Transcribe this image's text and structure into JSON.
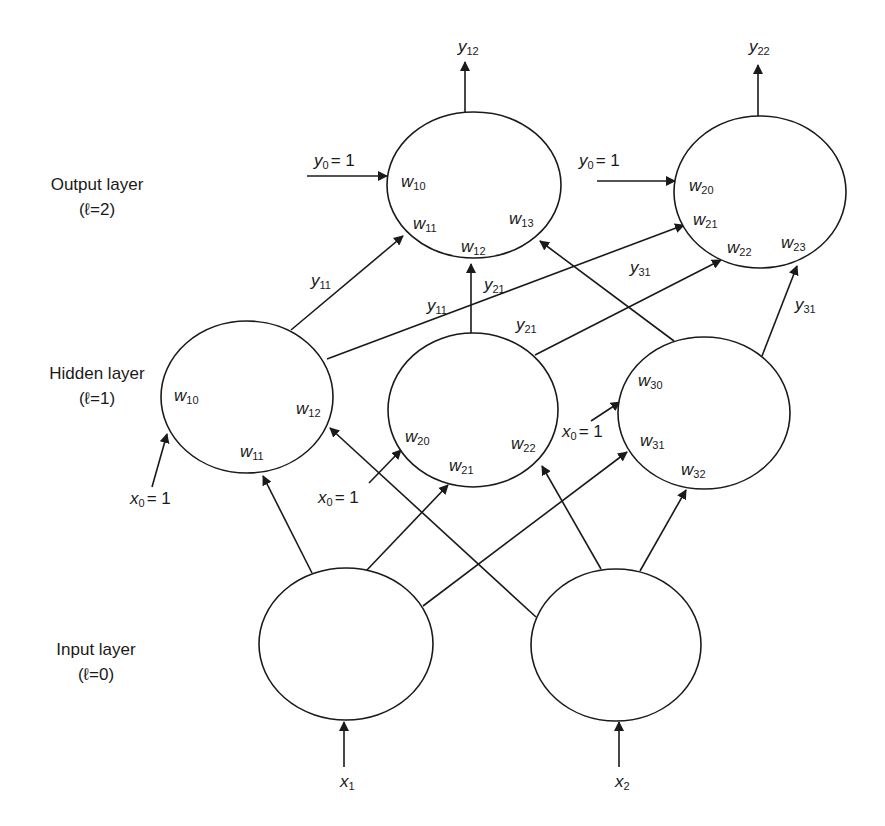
{
  "layers": [
    {
      "name": "Output layer",
      "index_label": "(ℓ=2)"
    },
    {
      "name": "Hidden layer",
      "index_label": "(ℓ=1)"
    },
    {
      "name": "Input layer",
      "index_label": "(ℓ=0)"
    }
  ],
  "nodes": {
    "output": [
      {
        "id": "o1",
        "cx": 474,
        "cy": 185,
        "output_label": {
          "base": "y",
          "sub": "12"
        },
        "bias": {
          "base": "y",
          "sub": "0",
          "eq": "= 1"
        },
        "weights": [
          {
            "base": "w",
            "sub": "10"
          },
          {
            "base": "w",
            "sub": "11"
          },
          {
            "base": "w",
            "sub": "12"
          },
          {
            "base": "w",
            "sub": "13"
          }
        ]
      },
      {
        "id": "o2",
        "cx": 760,
        "cy": 192,
        "output_label": {
          "base": "y",
          "sub": "22"
        },
        "bias": {
          "base": "y",
          "sub": "0",
          "eq": "= 1"
        },
        "weights": [
          {
            "base": "w",
            "sub": "20"
          },
          {
            "base": "w",
            "sub": "21"
          },
          {
            "base": "w",
            "sub": "22"
          },
          {
            "base": "w",
            "sub": "23"
          }
        ]
      }
    ],
    "hidden": [
      {
        "id": "h1",
        "cx": 247,
        "cy": 397,
        "bias": {
          "base": "x",
          "sub": "0",
          "eq": "= 1"
        },
        "weights": [
          {
            "base": "w",
            "sub": "10"
          },
          {
            "base": "w",
            "sub": "11"
          },
          {
            "base": "w",
            "sub": "12"
          }
        ]
      },
      {
        "id": "h2",
        "cx": 473,
        "cy": 410,
        "bias": {
          "base": "x",
          "sub": "0",
          "eq": "= 1"
        },
        "weights": [
          {
            "base": "w",
            "sub": "20"
          },
          {
            "base": "w",
            "sub": "21"
          },
          {
            "base": "w",
            "sub": "22"
          }
        ]
      },
      {
        "id": "h3",
        "cx": 704,
        "cy": 413,
        "bias": {
          "base": "x",
          "sub": "0",
          "eq": "= 1"
        },
        "weights": [
          {
            "base": "w",
            "sub": "30"
          },
          {
            "base": "w",
            "sub": "31"
          },
          {
            "base": "w",
            "sub": "32"
          }
        ]
      }
    ],
    "input": [
      {
        "id": "i1",
        "cx": 346,
        "cy": 644,
        "input_label": {
          "base": "x",
          "sub": "1"
        }
      },
      {
        "id": "i2",
        "cx": 616,
        "cy": 645,
        "input_label": {
          "base": "x",
          "sub": "2"
        }
      }
    ]
  },
  "edge_labels": {
    "h1_to_o1": {
      "base": "y",
      "sub": "11"
    },
    "h1_to_o2": {
      "base": "y",
      "sub": "11"
    },
    "h2_to_o1": {
      "base": "y",
      "sub": "21"
    },
    "h2_to_o2": {
      "base": "y",
      "sub": "21"
    },
    "h3_to_o2_a": {
      "base": "y",
      "sub": "31"
    },
    "h3_to_o2_b": {
      "base": "y",
      "sub": "31"
    }
  }
}
